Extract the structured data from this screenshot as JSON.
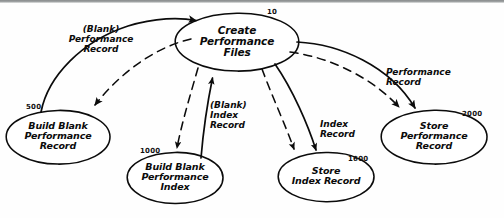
{
  "diagram": {
    "style": "hand-drawn",
    "ink_color": "#0b0b0b",
    "paper_color": "#fefefe",
    "nodes": [
      {
        "id": "create-performance-files",
        "number": "10",
        "lines": [
          "Create",
          "Performance",
          "Files"
        ],
        "cx": 237,
        "cy": 42,
        "rx": 62,
        "ry": 29,
        "font_size": 10.5
      },
      {
        "id": "build-blank-performance-record",
        "number": "500",
        "lines": [
          "Build Blank",
          "Performance",
          "Record"
        ],
        "cx": 58,
        "cy": 137,
        "rx": 52,
        "ry": 27,
        "font_size": 9.5
      },
      {
        "id": "build-blank-performance-index",
        "number": "1000",
        "lines": [
          "Build Blank",
          "Performance",
          "Index"
        ],
        "cx": 175,
        "cy": 178,
        "rx": 48,
        "ry": 26,
        "font_size": 9.5
      },
      {
        "id": "store-index-record",
        "number": "1600",
        "lines": [
          "Store",
          "Index Record"
        ],
        "cx": 326,
        "cy": 177,
        "rx": 48,
        "ry": 25,
        "font_size": 9.5
      },
      {
        "id": "store-performance-record",
        "number": "2000",
        "lines": [
          "Store",
          "Performance",
          "Record"
        ],
        "cx": 434,
        "cy": 137,
        "rx": 53,
        "ry": 27,
        "font_size": 9.5
      }
    ],
    "edge_labels": [
      {
        "id": "blank-performance-record",
        "lines": [
          "(Blank)",
          "Performance",
          "Record"
        ],
        "x": 60,
        "y": 26,
        "font_size": 9
      },
      {
        "id": "blank-index-record",
        "lines": [
          "(Blank)",
          "Index",
          "Record"
        ],
        "x": 210,
        "y": 100,
        "font_size": 9
      },
      {
        "id": "index-record",
        "lines": [
          "Index",
          "Record"
        ],
        "x": 320,
        "y": 118,
        "font_size": 9
      },
      {
        "id": "performance-record",
        "lines": [
          "Performance",
          "Record"
        ],
        "x": 388,
        "y": 66,
        "font_size": 9
      }
    ],
    "connections": [
      {
        "id": "call-build-blank-performance-record",
        "kind": "solid",
        "from": "build-blank-performance-record",
        "to": "create-performance-files"
      },
      {
        "id": "data-blank-performance-record",
        "kind": "dashed",
        "from": "create-performance-files",
        "to": "build-blank-performance-record"
      },
      {
        "id": "data-to-build-blank-performance-index",
        "kind": "dashed",
        "from": "create-performance-files",
        "to": "build-blank-performance-index"
      },
      {
        "id": "call-blank-index-record",
        "kind": "solid",
        "from": "build-blank-performance-index",
        "to": "create-performance-files"
      },
      {
        "id": "data-to-store-index-record",
        "kind": "dashed",
        "from": "create-performance-files",
        "to": "store-index-record"
      },
      {
        "id": "call-index-record",
        "kind": "solid",
        "from": "create-performance-files",
        "to": "store-index-record"
      },
      {
        "id": "data-to-store-performance-record",
        "kind": "dashed",
        "from": "create-performance-files",
        "to": "store-performance-record"
      },
      {
        "id": "call-performance-record",
        "kind": "solid",
        "from": "create-performance-files",
        "to": "store-performance-record"
      }
    ]
  }
}
